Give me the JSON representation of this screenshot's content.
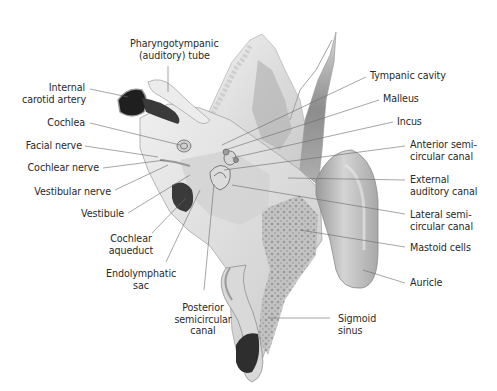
{
  "figure": {
    "style": "grayscale anatomical illustration with leader-line labels"
  },
  "labels": {
    "pharyngotympanic_tube": [
      "Pharyngotympanic",
      "(auditory) tube"
    ],
    "internal_carotid_artery": [
      "Internal",
      "carotid artery"
    ],
    "cochlea": [
      "Cochlea"
    ],
    "facial_nerve": [
      "Facial nerve"
    ],
    "cochlear_nerve": [
      "Cochlear nerve"
    ],
    "vestibular_nerve": [
      "Vestibular nerve"
    ],
    "vestibule": [
      "Vestibule"
    ],
    "cochlear_aqueduct": [
      "Cochlear",
      "aqueduct"
    ],
    "endolymphatic_sac": [
      "Endolymphatic",
      "sac"
    ],
    "posterior_semicircular_canal": [
      "Posterior",
      "semicircular",
      "canal"
    ],
    "tympanic_cavity": [
      "Tympanic cavity"
    ],
    "malleus": [
      "Malleus"
    ],
    "incus": [
      "Incus"
    ],
    "anterior_semicircular_canal": [
      "Anterior semi-",
      "circular canal"
    ],
    "external_auditory_canal": [
      "External",
      "auditory canal"
    ],
    "lateral_semicircular_canal": [
      "Lateral semi-",
      "circular canal"
    ],
    "mastoid_cells": [
      "Mastoid cells"
    ],
    "auricle": [
      "Auricle"
    ],
    "sigmoid_sinus": [
      "Sigmoid",
      "sinus"
    ]
  },
  "colors": {
    "text": "#2a2a2a",
    "leader": "#6a6a6a",
    "bone_light": "#e8e8e8",
    "bone_mid": "#bdbdbd",
    "bone_dark": "#7a7a7a",
    "vessel_dark": "#2b2b2b"
  }
}
